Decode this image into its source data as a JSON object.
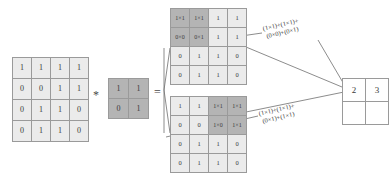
{
  "diagram": {
    "operators": {
      "convolution": "*",
      "equals": "="
    },
    "colors": {
      "cell_fill": "#ebebeb",
      "highlight_fill": "#b4b4b4",
      "border": "#9a9a9a",
      "text": "#3a3a3a",
      "result_fill": "#ffffff"
    }
  },
  "input_matrix": {
    "label": "input",
    "rows": 4,
    "cols": 4,
    "values": [
      [
        "1",
        "1",
        "1",
        "1"
      ],
      [
        "0",
        "0",
        "1",
        "1"
      ],
      [
        "0",
        "1",
        "1",
        "0"
      ],
      [
        "0",
        "1",
        "1",
        "0"
      ]
    ]
  },
  "kernel_matrix": {
    "label": "kernel",
    "rows": 2,
    "cols": 2,
    "values": [
      [
        "1",
        "1"
      ],
      [
        "0",
        "1"
      ]
    ]
  },
  "feature_map_top": {
    "label": "first-window",
    "rows": 4,
    "cols": 4,
    "highlight": [
      [
        0,
        0
      ],
      [
        0,
        1
      ],
      [
        1,
        0
      ],
      [
        1,
        1
      ]
    ],
    "values": [
      [
        "1×1",
        "1×1",
        "1",
        "1"
      ],
      [
        "0×0",
        "0×1",
        "1",
        "1"
      ],
      [
        "0",
        "1",
        "1",
        "0"
      ],
      [
        "0",
        "1",
        "1",
        "0"
      ]
    ]
  },
  "feature_map_bottom": {
    "label": "second-window",
    "rows": 4,
    "cols": 4,
    "highlight": [
      [
        0,
        2
      ],
      [
        0,
        3
      ],
      [
        1,
        2
      ],
      [
        1,
        3
      ]
    ],
    "values": [
      [
        "1",
        "1",
        "1×1",
        "1×1"
      ],
      [
        "0",
        "0",
        "1×0",
        "1×1"
      ],
      [
        "0",
        "1",
        "1",
        "0"
      ],
      [
        "0",
        "1",
        "1",
        "0"
      ]
    ]
  },
  "formula_top": {
    "line1": "(1×1)+(1×1)+",
    "line2": "(0×0)+(0×1)"
  },
  "formula_bottom": {
    "line1": "(1×1)+(1×1)+",
    "line2": "(0×1)+(1×1)"
  },
  "result_matrix": {
    "label": "output",
    "rows": 2,
    "cols": 2,
    "values": [
      [
        "2",
        "3"
      ],
      [
        "",
        ""
      ]
    ]
  }
}
